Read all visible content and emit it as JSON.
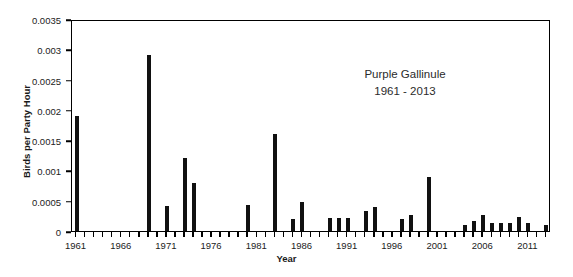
{
  "chart_data": {
    "type": "bar",
    "title": "Purple Gallinule",
    "subtitle": "1961 - 2013",
    "xlabel": "Year",
    "ylabel": "Birds per Party Hour",
    "xlim": [
      1960.5,
      2013.5
    ],
    "ylim": [
      0,
      0.0035
    ],
    "ytick_values": [
      0,
      0.0005,
      0.001,
      0.0015,
      0.002,
      0.0025,
      0.003,
      0.0035
    ],
    "ytick_labels": [
      "0",
      "0.0005",
      "0.001",
      "0.0015",
      "0.002",
      "0.0025",
      "0.003",
      "0.0035"
    ],
    "xtick_values": [
      1961,
      1966,
      1971,
      1976,
      1981,
      1986,
      1991,
      1996,
      2001,
      2006,
      2011
    ],
    "xtick_labels": [
      "1961",
      "1966",
      "1971",
      "1976",
      "1981",
      "1986",
      "1991",
      "1996",
      "2001",
      "2006",
      "2011"
    ],
    "grid": false,
    "legend": "none",
    "bar_color": "#111111",
    "categories": [
      1961,
      1962,
      1963,
      1964,
      1965,
      1966,
      1967,
      1968,
      1969,
      1970,
      1971,
      1972,
      1973,
      1974,
      1975,
      1976,
      1977,
      1978,
      1979,
      1980,
      1981,
      1982,
      1983,
      1984,
      1985,
      1986,
      1987,
      1988,
      1989,
      1990,
      1991,
      1992,
      1993,
      1994,
      1995,
      1996,
      1997,
      1998,
      1999,
      2000,
      2001,
      2002,
      2003,
      2004,
      2005,
      2006,
      2007,
      2008,
      2009,
      2010,
      2011,
      2012,
      2013
    ],
    "values": [
      0.0019,
      0,
      0,
      0,
      0,
      0,
      0,
      0,
      0.0029,
      0,
      0.00042,
      0,
      0.0012,
      0.0008,
      0,
      0,
      0,
      0,
      0,
      0.00043,
      0,
      0,
      0.0016,
      0,
      0.0002,
      0.00048,
      0,
      0,
      0.00022,
      0.00022,
      0.00022,
      0,
      0.00033,
      0.0004,
      0,
      0,
      0.0002,
      0.00026,
      0,
      0.0009,
      0,
      0,
      0,
      0.0001,
      0.00017,
      0.00026,
      0.00013,
      0.00014,
      0.00013,
      0.00023,
      0.00013,
      0,
      0.0001
    ]
  }
}
